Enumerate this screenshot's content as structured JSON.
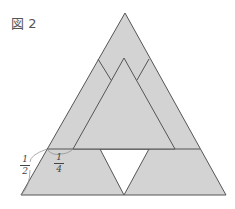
{
  "figure": {
    "title": "図 2",
    "fill_color": "#d3d3d3",
    "line_color": "#555555",
    "hole_color": "#ffffff"
  },
  "labels": {
    "half": {
      "numerator": "1",
      "denominator": "2"
    },
    "quarter": {
      "numerator": "1",
      "denominator": "4"
    }
  },
  "shapes": {
    "outer_triangle": {
      "apex": [
        125,
        13
      ],
      "bottom_left": [
        21,
        195
      ],
      "bottom_right": [
        226,
        195
      ]
    },
    "inner_triangle": {
      "apex": [
        124,
        58
      ],
      "base_left": [
        73,
        149
      ],
      "base_right": [
        175,
        149
      ]
    },
    "horizontal_line_y": 149,
    "hole_triangle": {
      "top_left": [
        100,
        149
      ],
      "top_right": [
        149,
        149
      ],
      "bottom": [
        124,
        195
      ]
    }
  }
}
